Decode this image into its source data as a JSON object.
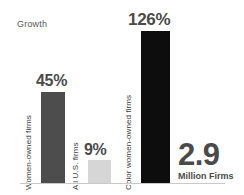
{
  "chart_data": {
    "type": "bar",
    "title": "Growth",
    "xlabel": "",
    "ylabel": "",
    "categories": [
      "Women-owned firms",
      "All U.S. firms",
      "Color women-owned firms"
    ],
    "values": [
      45,
      9,
      126
    ],
    "value_labels": [
      "45%",
      "9%",
      "126%"
    ],
    "unit": "%",
    "ylim": [
      0,
      126
    ],
    "grid": false,
    "legend": "none",
    "series": [
      {
        "name": "Growth",
        "values": [
          45,
          9,
          126
        ]
      }
    ],
    "bar_colors": [
      "#4d4d4d",
      "#d6d6d6",
      "#0d0d0d"
    ],
    "annotations": [
      {
        "number": "2.9",
        "caption": "Million Firms",
        "attached_to": "Color women-owned firms"
      }
    ]
  },
  "chart": {
    "title": "Growth",
    "bars": [
      {
        "id": "women-owned",
        "label": "Women-owned firms",
        "value_label": "45%",
        "color": "#4d4d4d"
      },
      {
        "id": "all-us",
        "label": "All U.S. firms",
        "value_label": "9%",
        "color": "#d6d6d6"
      },
      {
        "id": "color-women-owned",
        "label": "Color women-owned firms",
        "value_label": "126%",
        "color": "#0d0d0d"
      }
    ],
    "annotation": {
      "number": "2.9",
      "caption": "Million Firms"
    }
  }
}
